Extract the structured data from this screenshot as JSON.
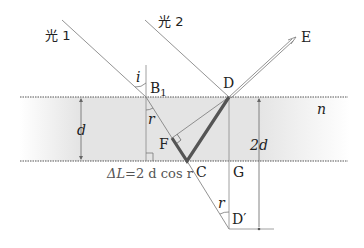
{
  "diagram": {
    "rays": {
      "ray1_label": "光 1",
      "ray2_label": "光 2"
    },
    "points": {
      "B1": "B",
      "B1_sub": "1",
      "D": "D",
      "E": "E",
      "F": "F",
      "C": "C",
      "G": "G",
      "D_prime": "D′"
    },
    "angles": {
      "incidence": "i",
      "refraction_top": "r",
      "refraction_bottom": "r"
    },
    "dimensions": {
      "thickness": "d",
      "double_thickness": "2d",
      "refractive_index": "n"
    },
    "formula": {
      "lhs": "ΔL",
      "eq": "=",
      "rhs": "2 d cos r"
    },
    "colors": {
      "film": "#e3e3e3",
      "line": "#666666",
      "thick_path": "#555555",
      "surface_dots": "#555555"
    }
  }
}
